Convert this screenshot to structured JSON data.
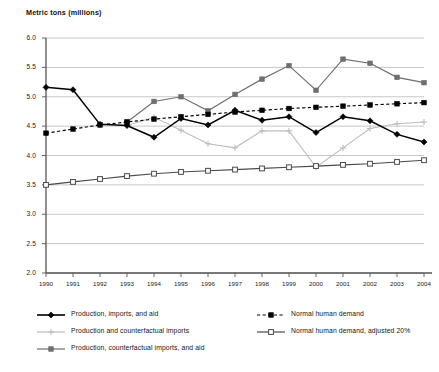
{
  "chart_data": {
    "type": "line",
    "title": "Metric tons (millions)",
    "xlabel": "",
    "ylabel": "Metric tons (millions)",
    "ylim": [
      2.0,
      6.0
    ],
    "ytick_step": 0.5,
    "grid": true,
    "legend_position": "bottom",
    "x": [
      1990,
      1991,
      1992,
      1993,
      1994,
      1995,
      1996,
      1997,
      1998,
      1999,
      2000,
      2001,
      2002,
      2003,
      2004
    ],
    "categories": [
      "1990",
      "1991",
      "1992",
      "1993",
      "1994",
      "1995",
      "1996",
      "1997",
      "1998",
      "1999",
      "2000",
      "2001",
      "2002",
      "2003",
      "2004"
    ],
    "yticks": [
      "2.0",
      "2.5",
      "3.0",
      "3.5",
      "4.0",
      "4.5",
      "5.0",
      "5.5",
      "6.0"
    ],
    "series": [
      {
        "name": "Production, imports, and aid",
        "color": "#000000",
        "marker": "diamond",
        "line": "solid",
        "values": [
          5.16,
          5.12,
          4.53,
          4.51,
          4.31,
          4.63,
          4.52,
          4.77,
          4.6,
          4.66,
          4.39,
          4.66,
          4.59,
          4.36,
          4.23
        ]
      },
      {
        "name": "Production and counterfactual imports",
        "color": "#bdbdbd",
        "marker": "plus",
        "line": "solid",
        "values": [
          null,
          null,
          null,
          4.51,
          4.65,
          4.43,
          4.2,
          4.13,
          4.42,
          4.42,
          3.8,
          4.13,
          4.46,
          4.54,
          4.57
        ]
      },
      {
        "name": "Production, counterfactual imports, and aid",
        "color": "#6e6e6e",
        "marker": "square",
        "line": "solid",
        "values": [
          null,
          null,
          null,
          4.57,
          4.92,
          5.0,
          4.76,
          5.04,
          5.3,
          5.53,
          5.11,
          5.64,
          5.57,
          5.33,
          5.24
        ]
      },
      {
        "name": "Normal human demand",
        "color": "#000000",
        "marker": "square",
        "line": "dashed",
        "values": [
          4.38,
          4.45,
          4.52,
          4.57,
          4.62,
          4.66,
          4.7,
          4.74,
          4.77,
          4.8,
          4.82,
          4.84,
          4.86,
          4.88,
          4.9
        ]
      },
      {
        "name": "Normal human demand, adjusted 20%",
        "color": "#4a4a4a",
        "marker": "open-square",
        "line": "solid",
        "values": [
          3.5,
          3.55,
          3.6,
          3.65,
          3.69,
          3.72,
          3.74,
          3.76,
          3.78,
          3.8,
          3.82,
          3.84,
          3.86,
          3.89,
          3.92
        ]
      }
    ]
  },
  "legend": {
    "items": [
      {
        "label": "Production, imports, and aid",
        "series_index": 0
      },
      {
        "label": "Production and counterfactual imports",
        "series_index": 1
      },
      {
        "label": "Production, counterfactual imports, and aid",
        "series_index": 2
      },
      {
        "label": "Normal human demand",
        "series_index": 3
      },
      {
        "label": "Normal human demand, adjusted 20%",
        "series_index": 4
      }
    ]
  }
}
